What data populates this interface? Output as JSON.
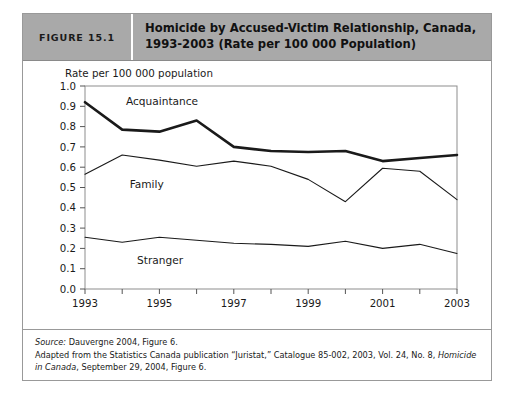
{
  "figure": {
    "number_label": "FIGURE 15.1",
    "title_line1": "Homicide by Accused-Victim Relationship, Canada,",
    "title_line2": "1993-2003 (Rate per 100 000 Population)"
  },
  "footer": {
    "source_prefix": "Source:",
    "source_text": " Dauvergne 2004, Figure 6.",
    "adapted_part1": "Adapted from the Statistics Canada publication “Juristat,” Catalogue 85-002, 2003, Vol. 24, No. 8, ",
    "adapted_italic": "Homicide in Canada",
    "adapted_part2": ", September 29, 2004, Figure 6."
  },
  "colors": {
    "header_bg": "#a9a9a9",
    "line_color": "#1a1a1a",
    "frame": "#8d8d8d"
  },
  "chart_data": {
    "type": "line",
    "title": "Homicide by Accused-Victim Relationship, Canada, 1993-2003 (Rate per 100 000 Population)",
    "xlabel": "",
    "ylabel": "Rate per 100 000 population",
    "x": [
      1993,
      1994,
      1995,
      1996,
      1997,
      1998,
      1999,
      2000,
      2001,
      2002,
      2003
    ],
    "xtick_labels": [
      "1993",
      "1995",
      "1997",
      "1999",
      "2001",
      "2003"
    ],
    "xtick_values": [
      1993,
      1995,
      1997,
      1999,
      2001,
      2003
    ],
    "ytick_labels": [
      "0.0",
      "0.1",
      "0.2",
      "0.3",
      "0.4",
      "0.5",
      "0.6",
      "0.7",
      "0.8",
      "0.9",
      "1.0"
    ],
    "ylim": [
      0.0,
      1.0
    ],
    "xlim": [
      1993,
      2003
    ],
    "grid": false,
    "legend": "inline-labels",
    "series": [
      {
        "name": "Acquaintance",
        "stroke_width": 2.6,
        "label_x": 1994.1,
        "label_y": 0.925,
        "values": [
          0.92,
          0.785,
          0.775,
          0.83,
          0.7,
          0.68,
          0.675,
          0.68,
          0.63,
          0.645,
          0.66
        ]
      },
      {
        "name": "Family",
        "stroke_width": 1.1,
        "label_x": 1994.2,
        "label_y": 0.515,
        "values": [
          0.565,
          0.66,
          0.635,
          0.605,
          0.63,
          0.605,
          0.54,
          0.43,
          0.595,
          0.58,
          0.44
        ]
      },
      {
        "name": "Stranger",
        "stroke_width": 1.1,
        "label_x": 1994.4,
        "label_y": 0.145,
        "values": [
          0.255,
          0.23,
          0.255,
          0.24,
          0.225,
          0.22,
          0.21,
          0.235,
          0.2,
          0.22,
          0.175
        ]
      }
    ]
  }
}
